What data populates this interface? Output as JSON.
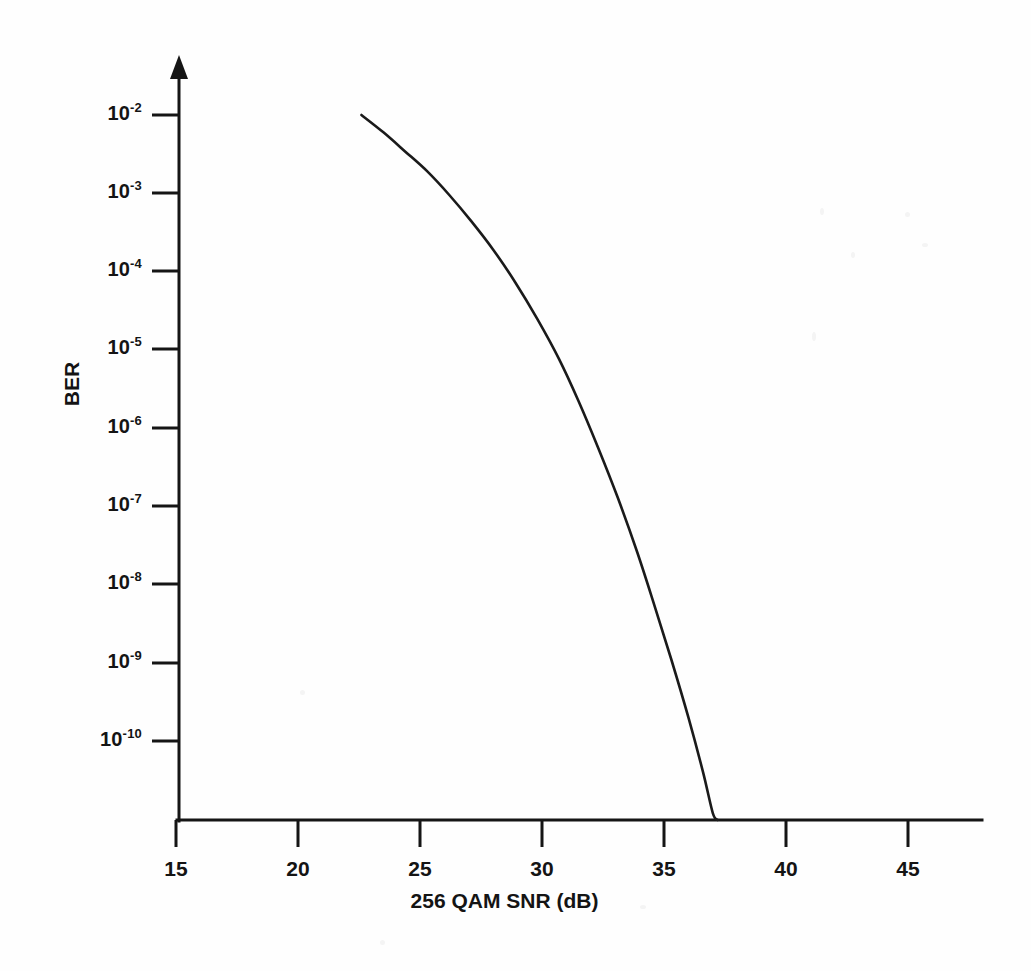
{
  "chart_data": {
    "type": "line",
    "title": "",
    "xlabel": "256 QAM SNR (dB)",
    "ylabel": "BER",
    "xlim": [
      15,
      48.5
    ],
    "ylim": [
      1e-11,
      0.01
    ],
    "yscale": "log",
    "grid": false,
    "legend": null,
    "xticks": [
      15,
      20,
      25,
      30,
      35,
      40,
      45
    ],
    "xtick_labels": [
      "15",
      "20",
      "25",
      "30",
      "35",
      "40",
      "45"
    ],
    "yticks": [
      0.01,
      0.001,
      0.0001,
      1e-05,
      1e-06,
      1e-07,
      1e-08,
      1e-09,
      1e-10
    ],
    "ytick_labels": [
      "10-2",
      "10-3",
      "10-4",
      "10-5",
      "10-6",
      "10-7",
      "10-8",
      "10-9",
      "10-10"
    ],
    "ytick_mantissa": [
      "10",
      "10",
      "10",
      "10",
      "10",
      "10",
      "10",
      "10",
      "10"
    ],
    "ytick_exponents": [
      "-2",
      "-3",
      "-4",
      "-5",
      "-6",
      "-7",
      "-8",
      "-9",
      "-10"
    ],
    "series": [
      {
        "name": "256 QAM BER",
        "color": "#1a1a1a",
        "x": [
          22.6,
          23.5,
          24.4,
          25.3,
          26.2,
          27.1,
          28.0,
          28.9,
          29.8,
          30.7,
          31.5,
          32.3,
          33.1,
          33.9,
          34.6,
          35.3,
          36.0,
          36.6,
          37.0,
          37.2
        ],
        "y": [
          0.01,
          0.006,
          0.0034,
          0.0019,
          0.00095,
          0.00044,
          0.00019,
          7.3e-05,
          2.5e-05,
          7.6e-06,
          2.2e-06,
          5.6e-07,
          1.3e-07,
          2.6e-08,
          5.5e-09,
          1.1e-09,
          2e-10,
          4e-11,
          1.2e-11,
          4e-12
        ]
      }
    ],
    "annotations": [],
    "axis_arrow": "up"
  },
  "axes": {
    "x_title": "256 QAM SNR (dB)",
    "y_title": "BER"
  },
  "xticks": [
    {
      "label": "15"
    },
    {
      "label": "20"
    },
    {
      "label": "25"
    },
    {
      "label": "30"
    },
    {
      "label": "35"
    },
    {
      "label": "40"
    },
    {
      "label": "45"
    }
  ],
  "yticks": [
    {
      "base": "10",
      "exp": "-2"
    },
    {
      "base": "10",
      "exp": "-3"
    },
    {
      "base": "10",
      "exp": "-4"
    },
    {
      "base": "10",
      "exp": "-5"
    },
    {
      "base": "10",
      "exp": "-6"
    },
    {
      "base": "10",
      "exp": "-7"
    },
    {
      "base": "10",
      "exp": "-8"
    },
    {
      "base": "10",
      "exp": "-9"
    },
    {
      "base": "10",
      "exp": "-10"
    }
  ],
  "colors": {
    "curve": "#1a1a1a",
    "axis": "#151515",
    "background": "#fefefe",
    "text": "#141414"
  }
}
